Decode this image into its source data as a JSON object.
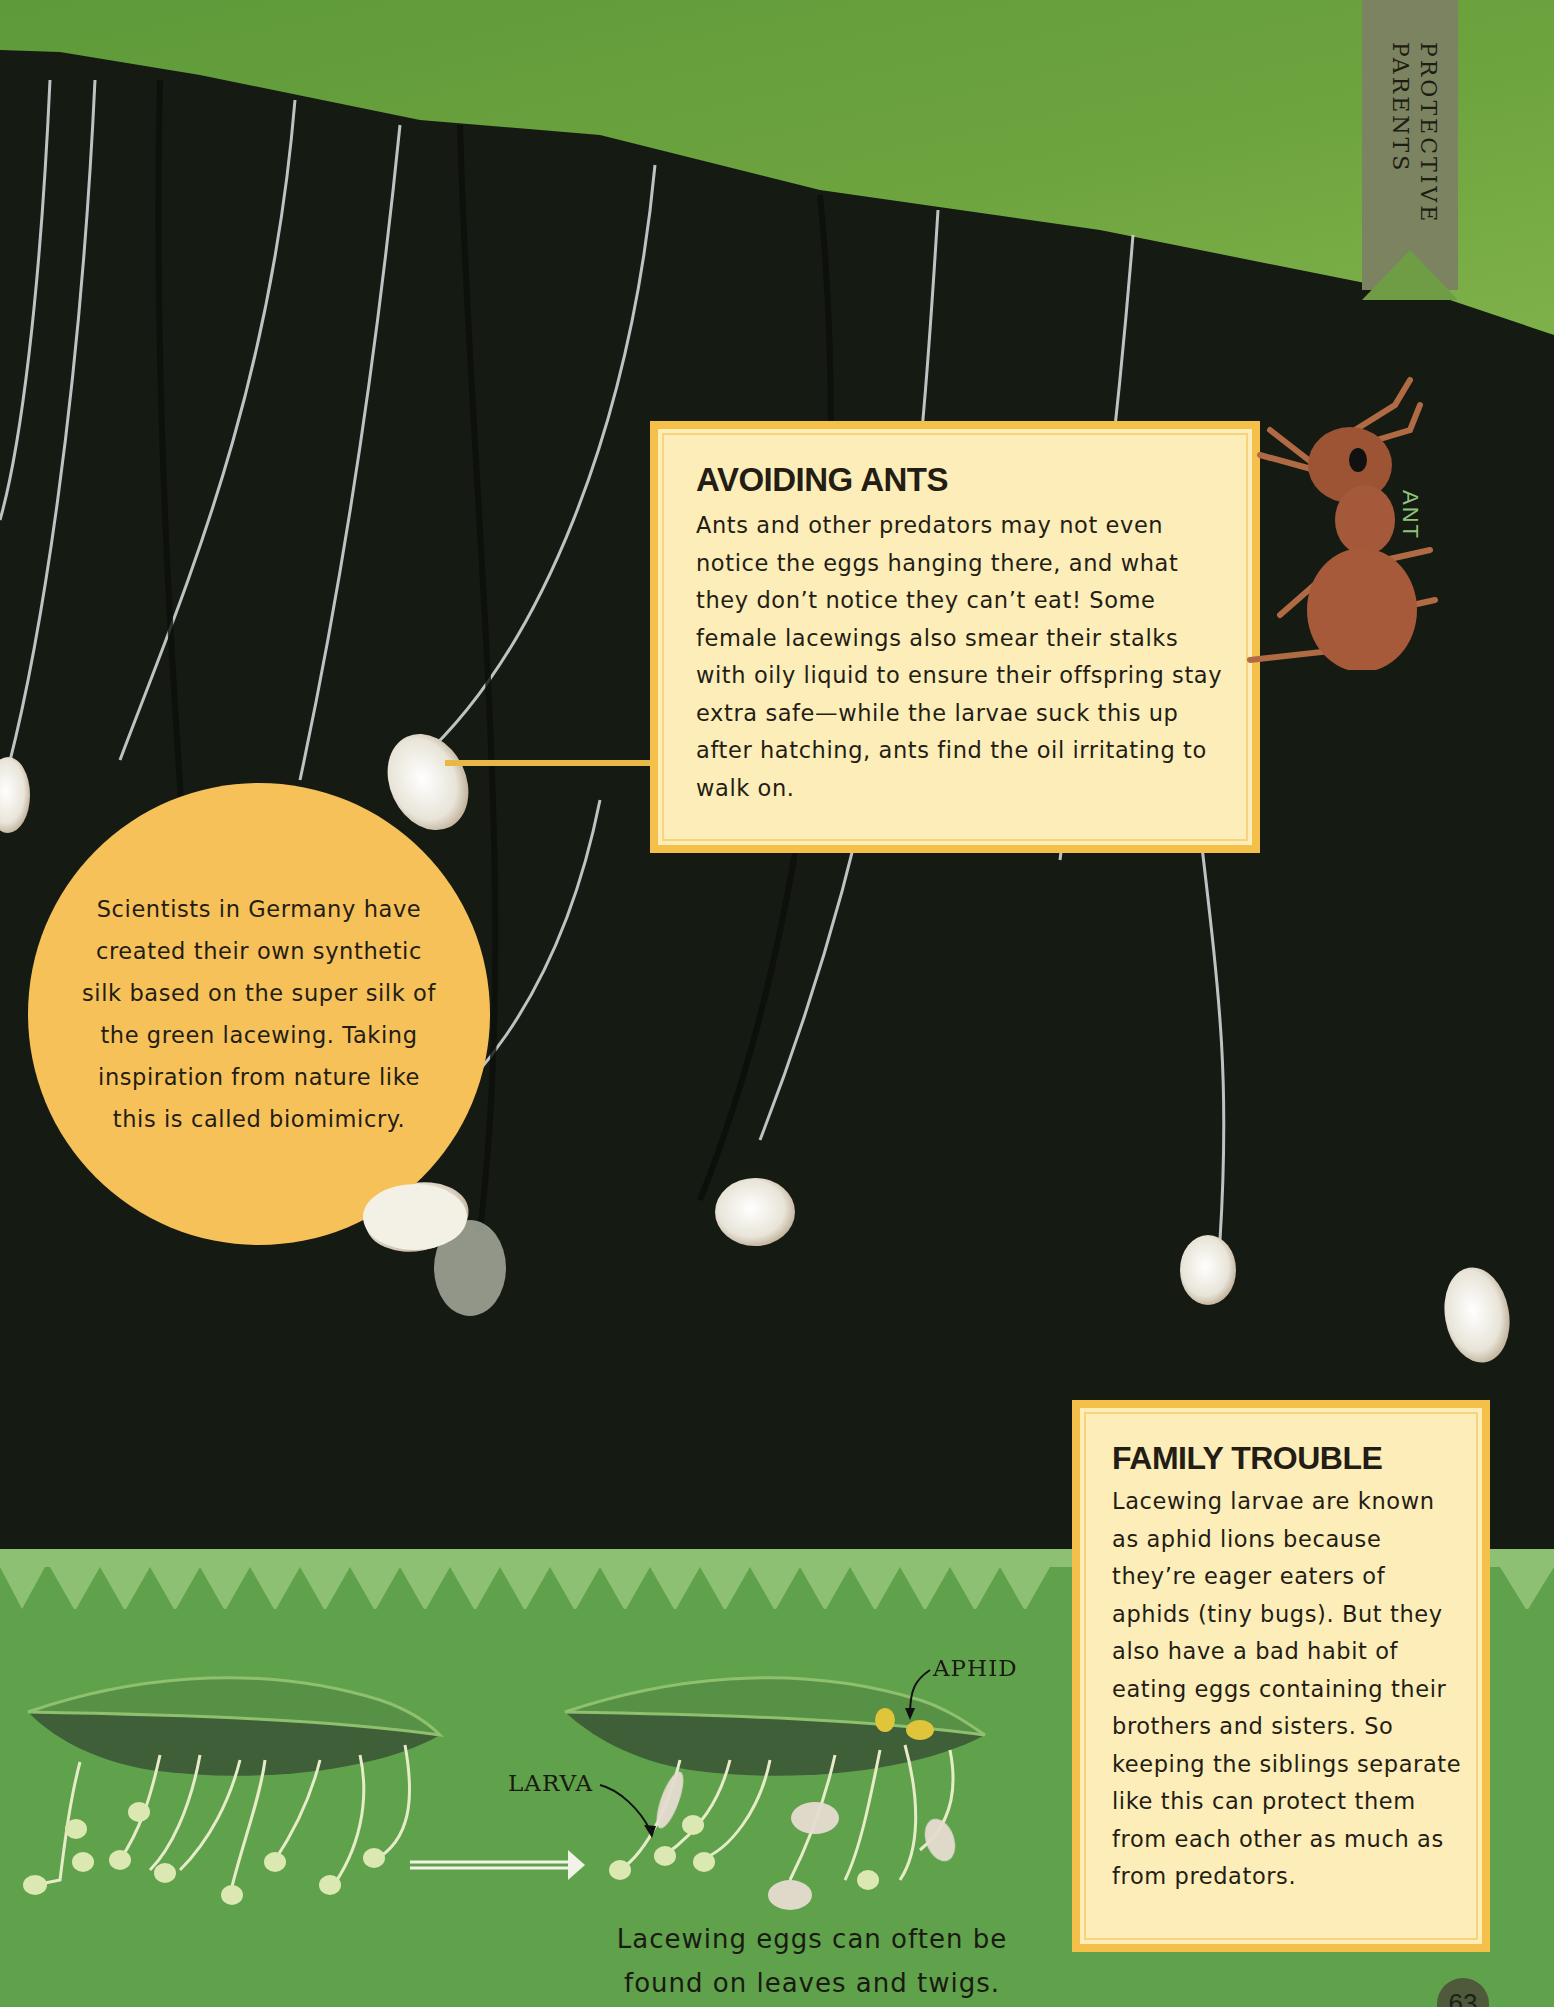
{
  "section_tab": {
    "label": "PROTECTIVE PARENTS"
  },
  "avoiding_ants": {
    "title": "AVOIDING ANTS",
    "body": "Ants and other predators may not even notice the eggs hanging there, and what they don’t notice they can’t eat! Some female lacewings also smear their stalks with oily liquid to ensure their offspring stay extra safe—while the larvae suck this up after hatching, ants find the oil irritating to walk on."
  },
  "ant_label": "ANT",
  "fact_circle": {
    "body": "Scientists in Germany have created their own synthetic silk based on the super silk of the green lacewing. Taking inspiration from nature like this is called biomimicry."
  },
  "family_trouble": {
    "title": "FAMILY TROUBLE",
    "body": "Lacewing larvae are known as aphid lions because they’re eager eaters of aphids (tiny bugs). But they also have a bad habit of eating eggs containing their brothers and sisters. So keeping the siblings separate like this can protect them from each other as much as from predators."
  },
  "illustration": {
    "label_aphid": "APHID",
    "label_larva": "LARVA",
    "caption": "Lacewing eggs can often be found on leaves and twigs."
  },
  "page_number": "63",
  "colors": {
    "leaf_green": "#6ea43e",
    "background_dark": "#151b13",
    "box_fill": "#fdedb8",
    "box_border": "#f5c04a",
    "circle_fill": "#f7c15a",
    "band_green": "#5fa24b",
    "tab": "#7c8360"
  }
}
